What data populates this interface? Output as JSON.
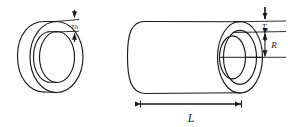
{
  "figure": {
    "background_color": "#ffffff",
    "line_color": "#1a1a1a",
    "left_part": {
      "name": "ring",
      "description": "short hollow cylindrical ring shown in isometric view",
      "dimension_label": "Th",
      "dimension_meaning": "wall thickness of ring"
    },
    "right_part": {
      "name": "cylinder",
      "description": "long hollow cylinder shown in isometric view",
      "thickness_label_base": "T",
      "thickness_label_sub": "s",
      "thickness_label": "Ts",
      "thickness_meaning": "wall thickness of cylinder shell",
      "radius_label": "R",
      "radius_meaning": "inner radius of cylinder",
      "length_label": "L",
      "length_meaning": "overall length of cylinder"
    }
  }
}
